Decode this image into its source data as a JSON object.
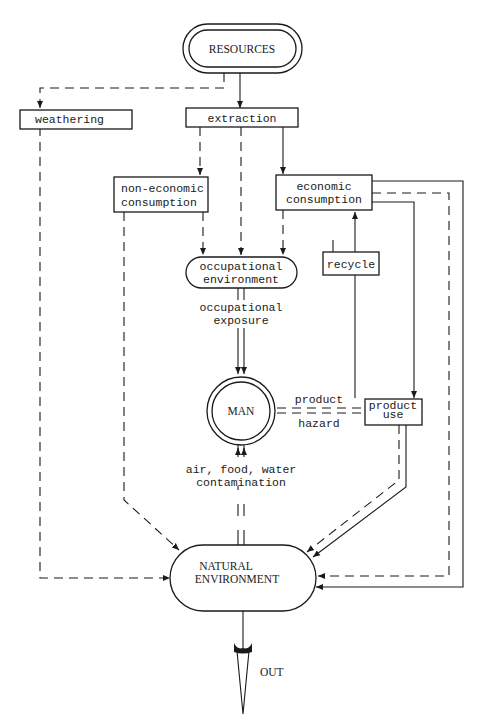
{
  "diagram": {
    "nodes": {
      "resources": {
        "label": "RESOURCES"
      },
      "weathering": {
        "label": "weathering"
      },
      "extraction": {
        "label": "extraction"
      },
      "non_economic_consumption": {
        "line1": "non-economic",
        "line2": "consumption"
      },
      "economic_consumption": {
        "line1": "economic",
        "line2": "consumption"
      },
      "occupational_environment": {
        "line1": "occupational",
        "line2": "environment"
      },
      "recycle": {
        "label": "recycle"
      },
      "man": {
        "label": "MAN"
      },
      "product_use": {
        "line1": "product",
        "line2": "use"
      },
      "natural_environment": {
        "line1": "NATURAL",
        "line2": "ENVIRONMENT"
      },
      "out": {
        "label": "OUT"
      }
    },
    "edge_labels": {
      "occupational_exposure": {
        "line1": "occupational",
        "line2": "exposure"
      },
      "product_hazard": {
        "line1": "product",
        "line2": "hazard"
      },
      "contamination": {
        "line1": "air, food, water",
        "line2": "contamination"
      }
    },
    "colors": {
      "ink": "#1a1a1a",
      "background": "#ffffff"
    }
  }
}
